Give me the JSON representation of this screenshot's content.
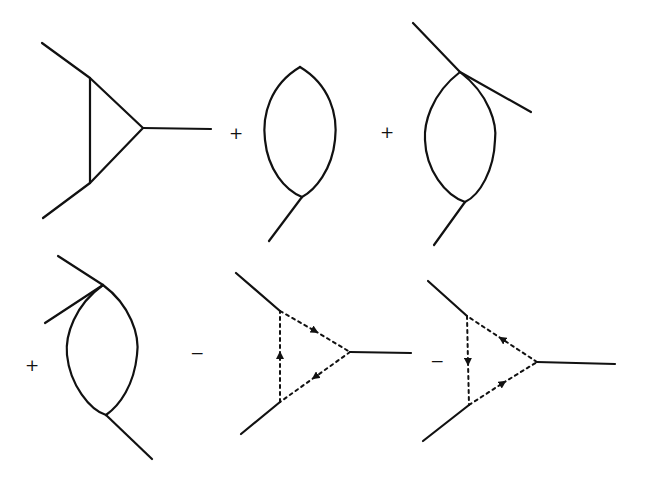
{
  "figure": {
    "line_color": "#111111",
    "background": "#ffffff",
    "terms": [
      {
        "id": "gluon-triangle",
        "operator": "",
        "type": "triangle-gluon-loop"
      },
      {
        "id": "bubble-one-external-bottom",
        "operator": "+",
        "type": "bubble-with-quartic-vertex"
      },
      {
        "id": "bubble-two-external-top",
        "operator": "+",
        "type": "bubble-with-quartic-vertex"
      },
      {
        "id": "bubble-two-external-left",
        "operator": "+",
        "type": "bubble-with-quartic-vertex"
      },
      {
        "id": "ghost-triangle-clockwise",
        "operator": "−",
        "type": "triangle-ghost-loop"
      },
      {
        "id": "ghost-triangle-counterclockwise",
        "operator": "−",
        "type": "triangle-ghost-loop"
      }
    ]
  },
  "operators": {
    "op1": "+",
    "op2": "+",
    "op3": "+",
    "op4": "−",
    "op5": "−"
  }
}
